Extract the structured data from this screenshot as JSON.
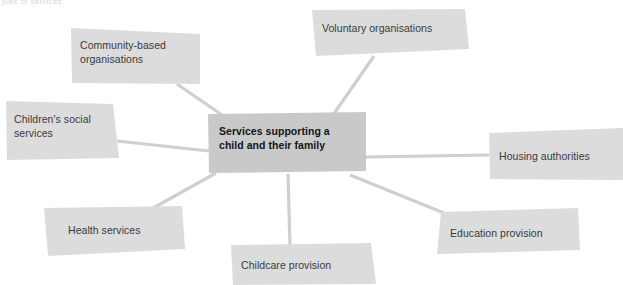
{
  "diagram": {
    "type": "mind-map",
    "title_fragment": "ples of services",
    "center": {
      "id": "center",
      "label": "Services supporting a\nchild and their family",
      "fill": "#c9c9c9",
      "text_color": "#141414",
      "bold": true,
      "shape": "208,114 366,112 366,171 209,173",
      "label_x": 219,
      "label_y": 124
    },
    "nodes": [
      {
        "id": "voluntary-organisations",
        "label": "Voluntary organisations",
        "fill": "#dcdcdc",
        "text_color": "#3a3a3a",
        "shape": "312,10 465,9 469,49 316,56",
        "label_x": 322,
        "label_y": 21
      },
      {
        "id": "community-based-organisations",
        "label": "Community-based\norganisations",
        "fill": "#dcdcdc",
        "text_color": "#3a3a3a",
        "shape": "71,28 200,34 200,84 72,83",
        "label_x": 80,
        "label_y": 38
      },
      {
        "id": "childrens-social-services",
        "label": "Children's social\nservices",
        "fill": "#dcdcdc",
        "text_color": "#3a3a3a",
        "shape": "6,101 113,104 119,158 7,160",
        "label_x": 14,
        "label_y": 112
      },
      {
        "id": "health-services",
        "label": "Health services",
        "fill": "#dcdcdc",
        "text_color": "#3a3a3a",
        "shape": "44,208 182,206 185,249 48,256",
        "label_x": 68,
        "label_y": 223
      },
      {
        "id": "childcare-provision",
        "label": "Childcare provision",
        "fill": "#dcdcdc",
        "text_color": "#3a3a3a",
        "shape": "231,245 371,243 376,284 233,285",
        "label_x": 241,
        "label_y": 258
      },
      {
        "id": "education-provision",
        "label": "Education provision",
        "fill": "#dcdcdc",
        "text_color": "#3a3a3a",
        "shape": "441,212 578,208 580,250 437,254",
        "label_x": 450,
        "label_y": 226
      },
      {
        "id": "housing-authorities",
        "label": "Housing authorities",
        "fill": "#dcdcdc",
        "text_color": "#3a3a3a",
        "shape": "489,133 623,128 623,180 490,179",
        "label_x": 499,
        "label_y": 149
      }
    ],
    "connectors": [
      {
        "id": "connector-voluntary",
        "from": "voluntary-organisations",
        "x1": 374,
        "y1": 56,
        "x2": 333,
        "y2": 115
      },
      {
        "id": "connector-community",
        "from": "community-based-organisations",
        "x1": 177,
        "y1": 84,
        "x2": 222,
        "y2": 115
      },
      {
        "id": "connector-childrens-social",
        "from": "childrens-social-services",
        "x1": 117,
        "y1": 141,
        "x2": 209,
        "y2": 151
      },
      {
        "id": "connector-health",
        "from": "health-services",
        "x1": 146,
        "y1": 212,
        "x2": 216,
        "y2": 173
      },
      {
        "id": "connector-childcare",
        "from": "childcare-provision",
        "x1": 290,
        "y1": 246,
        "x2": 288,
        "y2": 174
      },
      {
        "id": "connector-education",
        "from": "education-provision",
        "x1": 444,
        "y1": 213,
        "x2": 350,
        "y2": 175
      },
      {
        "id": "connector-housing",
        "from": "housing-authorities",
        "x1": 489,
        "y1": 155,
        "x2": 366,
        "y2": 157
      }
    ],
    "colors": {
      "background": "#ffffff",
      "center_fill": "#c9c9c9",
      "node_fill": "#dcdcdc",
      "connector": "#cfcfcf"
    }
  }
}
